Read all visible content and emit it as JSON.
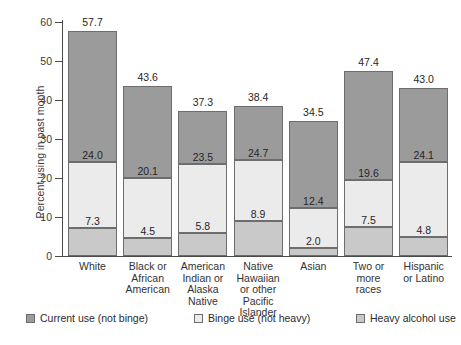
{
  "chart_data": {
    "type": "bar",
    "subtype": "stacked-bar",
    "title": "",
    "xlabel": "",
    "ylabel": "Percent using in past month",
    "ylim": [
      0,
      60
    ],
    "yticks": [
      0,
      10,
      20,
      30,
      40,
      50,
      60
    ],
    "ytick_labels": [
      "0",
      "10",
      "20",
      "30",
      "40",
      "50",
      "60"
    ],
    "grid": false,
    "legend_position": "bottom",
    "categories": [
      "White",
      "Black or African American",
      "American Indian or Alaska Native",
      "Native Hawaiian or other Pacific Islander",
      "Asian",
      "Two or more races",
      "Hispanic or Latino"
    ],
    "category_lines": [
      [
        "White"
      ],
      [
        "Black or",
        "African",
        "American"
      ],
      [
        "American",
        "Indian or",
        "Alaska Native"
      ],
      [
        "Native",
        "Hawaiian",
        "or other",
        "Pacific",
        "Islander"
      ],
      [
        "Asian"
      ],
      [
        "Two or",
        "more",
        "races"
      ],
      [
        "Hispanic",
        "or Latino"
      ]
    ],
    "series": [
      {
        "name": "Current use (not binge)",
        "color": "#9b9b9b",
        "values": [
          33.7,
          23.5,
          13.8,
          13.7,
          20.1,
          27.8,
          18.9
        ],
        "labels": [
          "24.0",
          "20.1",
          "23.5",
          "24.7",
          "12.4",
          "19.6",
          "24.1"
        ],
        "label_meaning": "value shown is the boundary (top of binge+heavy stack) printed inside the current-use segment"
      },
      {
        "name": "Binge use (not heavy)",
        "color": "#ebebeb",
        "values": [
          16.7,
          15.6,
          17.7,
          15.8,
          10.4,
          12.1,
          19.3
        ],
        "labels": [
          "7.3",
          "4.5",
          "5.8",
          "8.9",
          "2.0",
          "7.5",
          "4.8"
        ],
        "label_meaning": "value shown is the boundary (top of heavy stack) printed inside the binge segment"
      },
      {
        "name": "Heavy alcohol use",
        "color": "#c9c9c9",
        "values": [
          7.3,
          4.5,
          5.8,
          8.9,
          2.0,
          7.5,
          4.8
        ],
        "labels": [
          "",
          "",
          "",
          "",
          "",
          "",
          ""
        ]
      }
    ],
    "stack_boundaries": {
      "heavy_top": [
        7.3,
        4.5,
        5.8,
        8.9,
        2.0,
        7.5,
        4.8
      ],
      "binge_top": [
        24.0,
        20.1,
        23.5,
        24.7,
        12.4,
        19.6,
        24.1
      ],
      "total": [
        57.7,
        43.6,
        37.3,
        38.4,
        34.5,
        47.4,
        43.0
      ]
    },
    "totals": [
      57.7,
      43.6,
      37.3,
      38.4,
      34.5,
      47.4,
      43.0
    ],
    "total_labels": [
      "57.7",
      "43.6",
      "37.3",
      "38.4",
      "34.5",
      "47.4",
      "43.0"
    ]
  },
  "legend": {
    "items": [
      {
        "label": "Current use (not binge)",
        "color": "#9b9b9b"
      },
      {
        "label": "Binge use (not heavy)",
        "color": "#ebebeb"
      },
      {
        "label": "Heavy alcohol use",
        "color": "#c9c9c9"
      }
    ]
  }
}
